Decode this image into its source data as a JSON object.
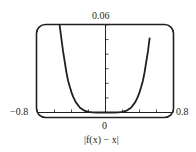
{
  "chart_data": {
    "type": "line",
    "title": "",
    "caption": "|f(x) − x|",
    "xlabel": "",
    "ylabel": "",
    "xlim": [
      -0.8,
      0.8
    ],
    "ylim": [
      0,
      0.06
    ],
    "x_ticks": [
      -0.8,
      -0.6,
      -0.4,
      -0.2,
      0,
      0.2,
      0.4,
      0.6,
      0.8
    ],
    "y_ticks": [
      0,
      0.01,
      0.02,
      0.03,
      0.04,
      0.05,
      0.06
    ],
    "tick_labels": {
      "x_min": "−0.8",
      "x_max": "0.8",
      "x_origin": "0",
      "y_max": "0.06"
    },
    "grid": false,
    "legend": null,
    "series": [
      {
        "name": "|f(x) − x|",
        "color": "#231f20",
        "x": [
          -0.54,
          -0.5,
          -0.46,
          -0.44,
          -0.42,
          -0.4,
          -0.38,
          -0.35,
          -0.3,
          -0.25,
          -0.2,
          -0.15,
          -0.1,
          -0.05,
          0,
          0.05,
          0.1,
          0.15,
          0.2,
          0.25,
          0.3,
          0.35,
          0.38,
          0.4,
          0.42,
          0.44,
          0.46,
          0.5,
          0.52
        ],
        "y": [
          0.06,
          0.0422,
          0.0276,
          0.0218,
          0.0176,
          0.0138,
          0.0107,
          0.0071,
          0.0033,
          0.0013,
          0.0004,
          0.0001,
          0.0,
          0.0,
          0.0,
          0.0,
          0.0,
          0.0001,
          0.0004,
          0.0013,
          0.0033,
          0.0071,
          0.0107,
          0.0138,
          0.0176,
          0.0218,
          0.0276,
          0.0422,
          0.0514
        ]
      }
    ],
    "frame": {
      "style": "rounded-rectangle",
      "color": "#231f20"
    }
  }
}
